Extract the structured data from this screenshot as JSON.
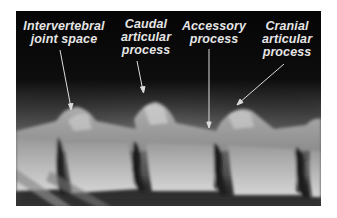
{
  "figure": {
    "kind": "radiograph",
    "background_color": "#070707",
    "label_color": "#e6e6e6",
    "labels": [
      {
        "id": "intervertebral",
        "text": "Intervertebral\njoint space"
      },
      {
        "id": "caudal",
        "text": "Caudal\narticular\nprocess"
      },
      {
        "id": "accessory",
        "text": "Accessory\nprocess"
      },
      {
        "id": "cranial",
        "text": "Cranial\narticular\nprocess"
      }
    ]
  }
}
